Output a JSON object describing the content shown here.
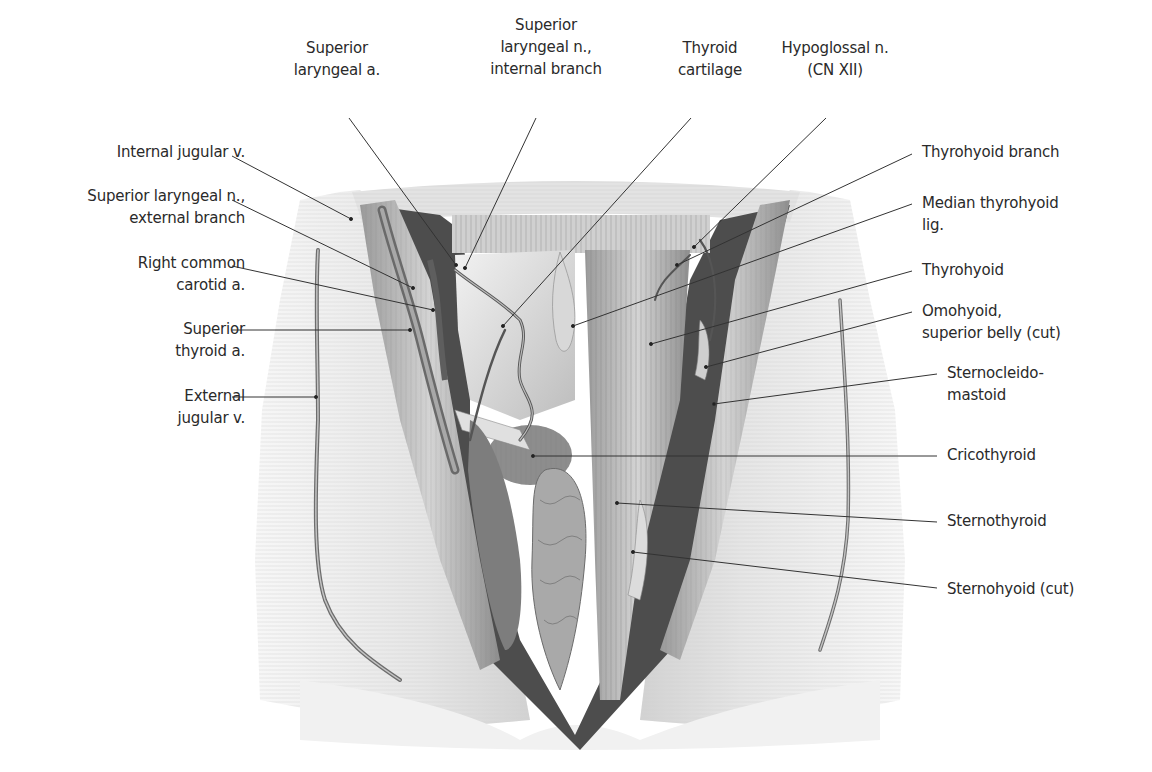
{
  "figure": {
    "style": "grayscale anatomical illustration",
    "colors": {
      "background": "#ffffff",
      "text": "#2a2a2a",
      "leader": "#333333",
      "skin": "#e9e9e9",
      "muscle": "#b5b5b5",
      "deep": "#5a5a5a"
    }
  },
  "labels": {
    "top": [
      {
        "id": "superior-laryngeal-a",
        "lines": [
          "Superior",
          "laryngeal a."
        ],
        "x": 337,
        "y": 37,
        "anchor": [
          456,
          265
        ],
        "from": [
          349,
          118
        ]
      },
      {
        "id": "superior-laryngeal-n-internal",
        "lines": [
          "Superior",
          "laryngeal n.,",
          "internal branch"
        ],
        "x": 546,
        "y": 14,
        "anchor": [
          465,
          268
        ],
        "from": [
          536,
          118
        ]
      },
      {
        "id": "thyroid-cartilage",
        "lines": [
          "Thyroid",
          "cartilage"
        ],
        "x": 710,
        "y": 37,
        "anchor": [
          503,
          326
        ],
        "from": [
          691,
          118
        ]
      },
      {
        "id": "hypoglossal-n",
        "lines": [
          "Hypoglossal n.",
          "(CN XII)"
        ],
        "x": 835,
        "y": 37,
        "anchor": [
          694,
          247
        ],
        "from": [
          826,
          118
        ]
      }
    ],
    "left": [
      {
        "id": "internal-jugular-v",
        "lines": [
          "Internal jugular v."
        ],
        "x": 245,
        "y": 141,
        "anchor": [
          351,
          219
        ],
        "from": [
          232,
          156
        ]
      },
      {
        "id": "superior-laryngeal-n-external",
        "lines": [
          "Superior laryngeal n.,",
          "external branch"
        ],
        "x": 245,
        "y": 185,
        "anchor": [
          413,
          288
        ],
        "from": [
          232,
          200
        ]
      },
      {
        "id": "right-common-carotid-a",
        "lines": [
          "Right common",
          "carotid a."
        ],
        "x": 245,
        "y": 252,
        "anchor": [
          433,
          310
        ],
        "from": [
          232,
          266
        ]
      },
      {
        "id": "superior-thyroid-a",
        "lines": [
          "Superior",
          "thyroid a."
        ],
        "x": 245,
        "y": 318,
        "anchor": [
          410,
          330
        ],
        "from": [
          232,
          330
        ]
      },
      {
        "id": "external-jugular-v",
        "lines": [
          "External",
          "jugular v."
        ],
        "x": 245,
        "y": 385,
        "anchor": [
          316,
          397
        ],
        "from": [
          232,
          397
        ]
      }
    ],
    "right": [
      {
        "id": "thyrohyoid-branch",
        "lines": [
          "Thyrohyoid branch"
        ],
        "x": 922,
        "y": 141,
        "anchor": [
          677,
          265
        ],
        "from": [
          912,
          154
        ]
      },
      {
        "id": "median-thyrohyoid-lig",
        "lines": [
          "Median thyrohyoid",
          "lig."
        ],
        "x": 922,
        "y": 192,
        "anchor": [
          573,
          326
        ],
        "from": [
          912,
          204
        ]
      },
      {
        "id": "thyrohyoid",
        "lines": [
          "Thyrohyoid"
        ],
        "x": 922,
        "y": 259,
        "anchor": [
          651,
          344
        ],
        "from": [
          912,
          271
        ]
      },
      {
        "id": "omohyoid-superior-belly",
        "lines": [
          "Omohyoid,",
          "superior belly (cut)"
        ],
        "x": 922,
        "y": 300,
        "anchor": [
          706,
          367
        ],
        "from": [
          912,
          312
        ]
      },
      {
        "id": "sternocleidomastoid",
        "lines": [
          "Sternocleido-",
          "mastoid"
        ],
        "x": 947,
        "y": 362,
        "anchor": [
          714,
          404
        ],
        "from": [
          937,
          374
        ]
      },
      {
        "id": "cricothyroid",
        "lines": [
          "Cricothyroid"
        ],
        "x": 947,
        "y": 444,
        "anchor": [
          533,
          456
        ],
        "from": [
          937,
          456
        ]
      },
      {
        "id": "sternothyroid",
        "lines": [
          "Sternothyroid"
        ],
        "x": 947,
        "y": 510,
        "anchor": [
          617,
          503
        ],
        "from": [
          937,
          522
        ]
      },
      {
        "id": "sternohyoid-cut",
        "lines": [
          "Sternohyoid (cut)"
        ],
        "x": 947,
        "y": 578,
        "anchor": [
          633,
          552
        ],
        "from": [
          937,
          588
        ]
      }
    ]
  }
}
